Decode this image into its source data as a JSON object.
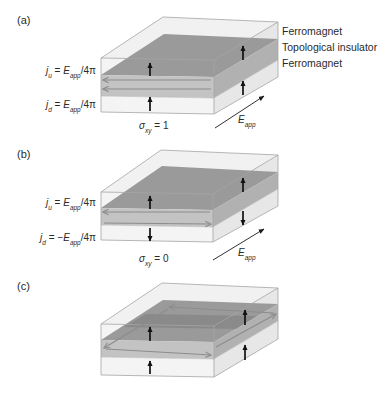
{
  "figure": {
    "layer_labels": {
      "top": "Ferromagnet",
      "middle": "Topological insulator",
      "bottom": "Ferromagnet"
    },
    "panels": {
      "a": {
        "label": "(a)",
        "j_upper": {
          "var": "j",
          "sub": "u",
          "eq": " = ",
          "sign": "",
          "rhs_var": "E",
          "rhs_sub": "app",
          "tail": "/4π"
        },
        "j_lower": {
          "var": "j",
          "sub": "d",
          "eq": " = ",
          "sign": "",
          "rhs_var": "E",
          "rhs_sub": "app",
          "tail": "/4π"
        },
        "sigma": {
          "var": "σ",
          "sub": "xy",
          "eq": " = ",
          "value": "1"
        },
        "field": {
          "var": "E",
          "sub": "app"
        },
        "magnetization": {
          "top_ferromagnet": "up-arrow-icon",
          "bottom_ferromagnet": "up-arrow-icon"
        },
        "surface_currents": {
          "upper": "left",
          "lower": "left"
        }
      },
      "b": {
        "label": "(b)",
        "j_upper": {
          "var": "j",
          "sub": "u",
          "eq": " = ",
          "sign": "",
          "rhs_var": "E",
          "rhs_sub": "app",
          "tail": "/4π"
        },
        "j_lower": {
          "var": "j",
          "sub": "d",
          "eq": " = ",
          "sign": "−",
          "rhs_var": "E",
          "rhs_sub": "app",
          "tail": "/4π"
        },
        "sigma": {
          "var": "σ",
          "sub": "xy",
          "eq": " = ",
          "value": "0"
        },
        "field": {
          "var": "E",
          "sub": "app"
        },
        "magnetization": {
          "top_ferromagnet": "up-arrow-icon",
          "bottom_ferromagnet": "down-arrow-icon"
        },
        "surface_currents": {
          "upper": "left",
          "lower": "right"
        }
      },
      "c": {
        "label": "(c)",
        "magnetization": {
          "top_ferromagnet": "up-arrow-icon",
          "bottom_ferromagnet": "up-arrow-icon"
        },
        "surface_currents": {
          "upper": "edge-loop",
          "lower": "edge-loop"
        }
      }
    },
    "colors": {
      "ferromagnet_face": "#f4f4f4",
      "ferromagnet_side": "#e7e7e7",
      "ti_top_surface": "#9a9a9a",
      "ti_front_face": "#c3c3c3",
      "ti_side_face": "#b1b1b1",
      "surface_current": "#8c8c8c",
      "magnetization_arrow": "#111111",
      "outline": "#a4a4a4"
    }
  }
}
